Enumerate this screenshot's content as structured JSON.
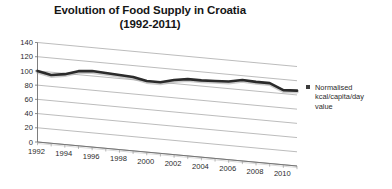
{
  "chart_data": {
    "type": "line",
    "title": "Evolution of Food Supply in Croatia (1992-2011)",
    "title_line1": "Evolution of Food Supply in Croatia",
    "title_line2": "(1992-2011)",
    "xlabel": "",
    "ylabel": "",
    "ylim": [
      0,
      140
    ],
    "ytick_step": 20,
    "yticks": [
      "0",
      "20",
      "40",
      "60",
      "80",
      "100",
      "120",
      "140"
    ],
    "grid": true,
    "style": "3-D perspective (Excel 3-D line)",
    "legend_position": "right",
    "legend": [
      {
        "name": "Normalised kcal/capita/day value",
        "lines": [
          "Normalised",
          "kcal/capita/day",
          "value"
        ],
        "color": "#2b2b2b",
        "marker": "square"
      }
    ],
    "x": [
      1992,
      1993,
      1994,
      1995,
      1996,
      1997,
      1998,
      1999,
      2000,
      2001,
      2002,
      2003,
      2004,
      2005,
      2006,
      2007,
      2008,
      2009,
      2010,
      2011
    ],
    "xtick_labels": [
      "1992",
      "1994",
      "1996",
      "1998",
      "2000",
      "2002",
      "2004",
      "2006",
      "2008",
      "2010"
    ],
    "series": [
      {
        "name": "Normalised kcal/capita/day value",
        "color": "#2b2b2b",
        "values": [
          100,
          96,
          99,
          105,
          107,
          106,
          105,
          104,
          100,
          100,
          105,
          108,
          108,
          109,
          110,
          114,
          113,
          113,
          105,
          106
        ]
      }
    ]
  }
}
